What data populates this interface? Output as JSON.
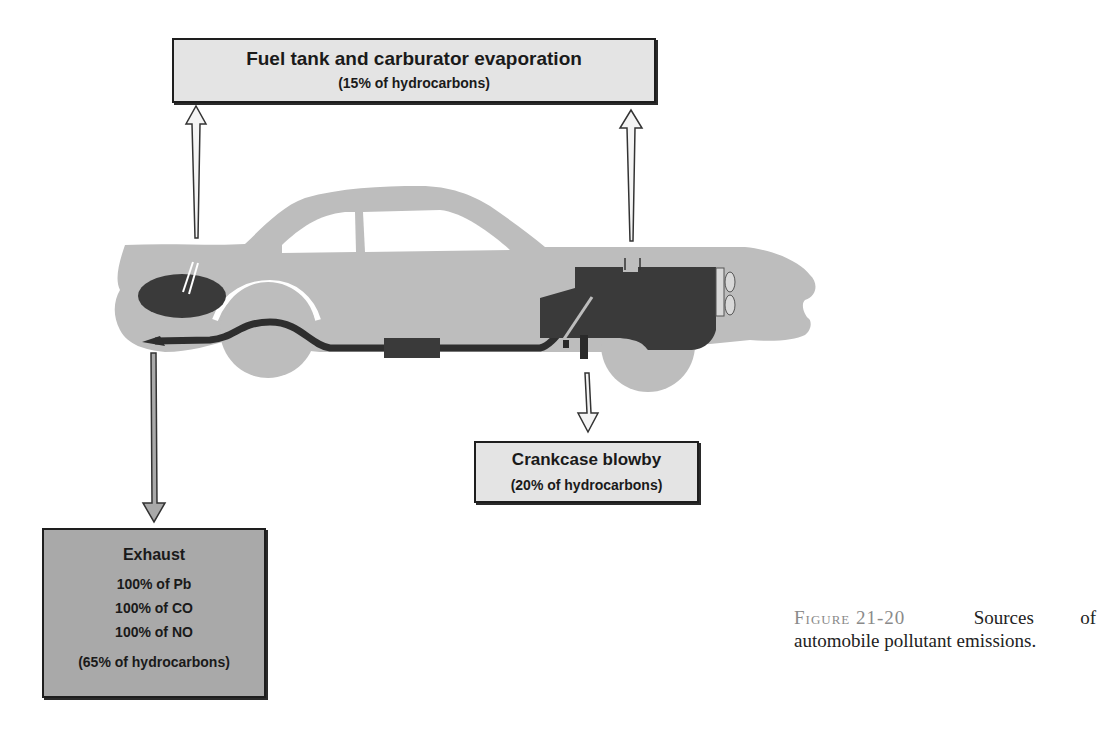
{
  "figure": {
    "label": "Figure 21-20",
    "caption_line1_words": [
      "Sources",
      "of"
    ],
    "caption_line2": "automobile pollutant emissions.",
    "caption_text": "Sources of automobile pollutant emissions."
  },
  "boxes": {
    "fuel_evaporation": {
      "title": "Fuel tank and carburator evaporation",
      "subtitle": "(15% of hydrocarbons)"
    },
    "crankcase": {
      "title": "Crankcase blowby",
      "subtitle": "(20% of hydrocarbons)"
    },
    "exhaust": {
      "title": "Exhaust",
      "lines": [
        "100% of Pb",
        "100% of CO",
        "100% of NO"
      ],
      "subtitle": "(65% of hydrocarbons)"
    }
  },
  "illustration": {
    "subject": "car-side-silhouette",
    "parts": [
      "fuel-tank",
      "exhaust-pipe",
      "muffler",
      "engine-block",
      "crankcase-vent",
      "radiator-fan",
      "rear-wheel",
      "front-wheel"
    ]
  },
  "colors": {
    "car_body": "#bdbdbd",
    "dark_parts": "#3a3a3a",
    "light_box": "#e4e4e4",
    "dark_box": "#a9a9a9",
    "arrow_outline": "#333333"
  }
}
